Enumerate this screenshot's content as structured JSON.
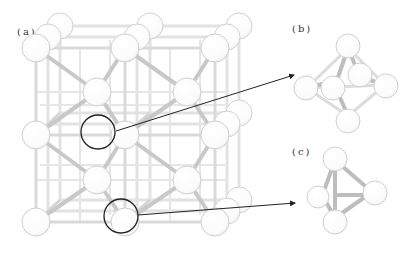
{
  "panels": {
    "a": {
      "label": "(a)",
      "description": "face-centered cubic lattice (2x2x2 cells)"
    },
    "b": {
      "label": "(b)",
      "description": "octahedral interstitial site"
    },
    "c": {
      "label": "(c)",
      "description": "tetrahedral interstitial site"
    }
  },
  "colors": {
    "atom_fill": "#ffffff",
    "atom_stroke": "#cfcfcf",
    "bond": "#d8d8d8",
    "bond_dark": "#bdbdbd",
    "highlight_circle": "#222222",
    "arrow": "#222222"
  }
}
